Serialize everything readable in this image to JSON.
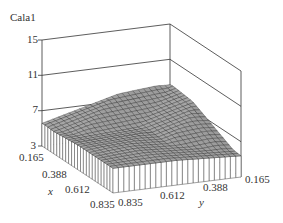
{
  "chart_data": {
    "type": "surface3d",
    "title": "",
    "zlabel": "Cala1",
    "xlabel": "x",
    "ylabel": "y",
    "z_ticks": [
      "3",
      "7",
      "11",
      "15"
    ],
    "x_ticks": [
      "0.165",
      "0.388",
      "0.612",
      "0.835"
    ],
    "y_ticks": [
      "0.835",
      "0.612",
      "0.388",
      "0.165"
    ],
    "zlim": [
      3,
      15
    ],
    "xlim": [
      0.165,
      0.835
    ],
    "ylim": [
      0.165,
      0.835
    ],
    "grid": 24,
    "corner_values": {
      "x0.165_y0.165": 3.2,
      "x0.165_y0.835": 8.0,
      "x0.835_y0.835": 5.8,
      "x0.835_y0.165": 4.2
    },
    "ridge_peak": {
      "x": 0.165,
      "y": 0.835,
      "z": 8.0
    }
  },
  "labels": {
    "zlabel": "Cala1",
    "z15": "15",
    "z11": "11",
    "z7": "7",
    "z3": "3",
    "x0": "0.165",
    "x1": "0.388",
    "x2": "0.612",
    "x3": "0.835",
    "xname": "x",
    "y3": "0.835",
    "y2": "0.612",
    "y1": "0.388",
    "y0": "0.165",
    "yname": "y"
  }
}
